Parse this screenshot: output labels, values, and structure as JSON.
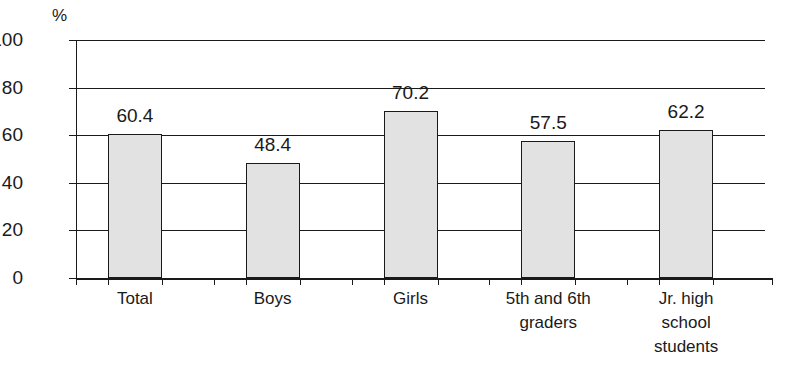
{
  "chart_data": {
    "type": "bar",
    "title": "",
    "subtitle": "",
    "xlabel": "",
    "ylabel": "",
    "unit_label": "%",
    "categories": [
      "Total",
      "Boys",
      "Girls",
      "5th and 6th graders",
      "Jr. high school students"
    ],
    "category_lines": [
      [
        "Total"
      ],
      [
        "Boys"
      ],
      [
        "Girls"
      ],
      [
        "5th and 6th",
        "graders"
      ],
      [
        "Jr. high",
        "school",
        "students"
      ]
    ],
    "values": [
      60.4,
      48.4,
      70.2,
      57.5,
      62.2
    ],
    "value_labels": [
      "60.4",
      "48.4",
      "70.2",
      "57.5",
      "62.2"
    ],
    "ylim": [
      0,
      100
    ],
    "ytick_values": [
      0,
      20,
      40,
      60,
      80,
      100
    ],
    "ytick_labels": [
      "0",
      "20",
      "40",
      "60",
      "80",
      "100"
    ],
    "grid": true,
    "grid_axis": "y",
    "legend": false,
    "legend_position": "none",
    "bar_fill_color": "#e2e2e2",
    "bar_border_color": "#1a1a1a",
    "axis_color": "#1a1a1a"
  }
}
